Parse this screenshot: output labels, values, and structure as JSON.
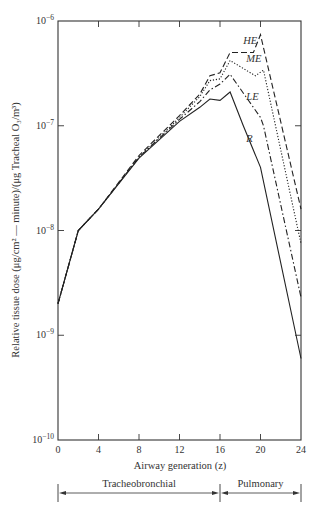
{
  "chart_data": {
    "type": "line",
    "title": "",
    "xlabel": "Airway generation (z)",
    "ylabel": "Relative tissue dose (μg/cm² — minute)/(μg Tracheal O₃/m³)",
    "xlim": [
      0,
      24
    ],
    "ylim": [
      1e-10,
      1e-06
    ],
    "yscale": "log",
    "x_ticks": [
      0,
      4,
      8,
      12,
      16,
      20,
      24
    ],
    "y_ticks": [
      {
        "value": 1e-06,
        "label_base": "10",
        "label_exp": "−6"
      },
      {
        "value": 1e-07,
        "label_base": "10",
        "label_exp": "−7"
      },
      {
        "value": 1e-08,
        "label_base": "10",
        "label_exp": "−8"
      },
      {
        "value": 1e-09,
        "label_base": "10",
        "label_exp": "−9"
      },
      {
        "value": 1e-10,
        "label_base": "10",
        "label_exp": "−10"
      }
    ],
    "grid": false,
    "legend": "inline labels",
    "series": [
      {
        "name": "HE",
        "style": "dashed",
        "x": [
          0,
          2,
          4,
          8,
          12,
          14,
          15,
          16,
          17,
          19.3,
          20,
          24
        ],
        "values": [
          2e-09,
          1e-08,
          1.6e-08,
          5.2e-08,
          1.25e-07,
          2e-07,
          3e-07,
          3.2e-07,
          5e-07,
          5e-07,
          7.4e-07,
          1.6e-08
        ]
      },
      {
        "name": "ME",
        "style": "dotted",
        "x": [
          0,
          2,
          4,
          8,
          12,
          14,
          15,
          16,
          17,
          19.5,
          20.3,
          24
        ],
        "values": [
          2e-09,
          1e-08,
          1.6e-08,
          5e-08,
          1.2e-07,
          1.9e-07,
          2.7e-07,
          2.8e-07,
          4.2e-07,
          3e-07,
          3.4e-07,
          7.5e-09
        ]
      },
      {
        "name": "LE",
        "style": "dash-dot",
        "x": [
          0,
          2,
          4,
          8,
          12,
          14,
          15,
          16,
          17,
          20,
          20.3,
          24
        ],
        "values": [
          2e-09,
          1e-08,
          1.6e-08,
          5e-08,
          1.15e-07,
          1.7e-07,
          2.2e-07,
          2.5e-07,
          3.1e-07,
          1.2e-07,
          1e-07,
          2.3e-09
        ]
      },
      {
        "name": "R",
        "style": "solid",
        "x": [
          0,
          2,
          4,
          8,
          12,
          14,
          15,
          16,
          17,
          18.3,
          20,
          24
        ],
        "values": [
          2e-09,
          1e-08,
          1.6e-08,
          4.9e-08,
          1.1e-07,
          1.5e-07,
          1.8e-07,
          1.75e-07,
          2.1e-07,
          1e-07,
          4e-08,
          6e-10
        ]
      }
    ],
    "annotations": [
      {
        "text": "HE",
        "x": 18.3,
        "y": 6e-07
      },
      {
        "text": "ME",
        "x": 18.6,
        "y": 4.1e-07
      },
      {
        "text": "LE",
        "x": 18.6,
        "y": 1.75e-07
      },
      {
        "text": "R",
        "x": 18.6,
        "y": 7e-08
      }
    ],
    "regions": [
      {
        "label": "Tracheobronchial",
        "x_start": 0,
        "x_end": 16
      },
      {
        "label": "Pulmonary",
        "x_start": 16,
        "x_end": 24
      }
    ]
  }
}
